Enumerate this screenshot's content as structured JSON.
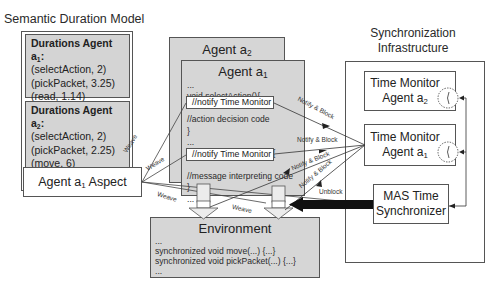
{
  "semantic_model": {
    "title": "Semantic Duration Model",
    "agent1": {
      "heading": "Durations Agent a",
      "heading_sub": "1",
      "heading_suffix": ":",
      "entries": [
        "(selectAction, 2)",
        "(pickPacket, 3.25)",
        "(read, 1.14)",
        "(move, 5)"
      ]
    },
    "agent2": {
      "heading": "Durations Agent a",
      "heading_sub": "2",
      "heading_suffix": ":",
      "entries": [
        "(selectAction, 2)",
        "(pickPacket, 2.25)",
        "(move, 6)"
      ]
    }
  },
  "aspect": {
    "label": "Agent a",
    "label_sub": "1",
    "label_suffix": " Aspect"
  },
  "agent2_box": {
    "title": "Agent a",
    "title_sub": "2"
  },
  "agent1_box": {
    "title": "Agent a",
    "title_sub": "1",
    "code_lines": [
      "...",
      "void selectAction(){",
      "//notify Time Monitor",
      "//action decision code",
      "}",
      "...",
      "void read(Message m){",
      "//notify Time Monitor",
      "//message interpreting code",
      "}",
      "..."
    ]
  },
  "environment": {
    "title": "Environment",
    "code_lines": [
      "...",
      "synchronized void move(...) {...}",
      "synchronized void pickPacket(...) {...}",
      "..."
    ]
  },
  "sync_infra": {
    "title_line1": "Synchronization",
    "title_line2": "Infrastructure",
    "monitor2": {
      "line1": "Time Monitor",
      "line2": "Agent a",
      "line2_sub": "2",
      "icon": "clock-icon"
    },
    "monitor1": {
      "line1": "Time Monitor",
      "line2": "Agent a",
      "line2_sub": "1",
      "icon": "clock-icon"
    },
    "synchronizer": {
      "line1": "MAS Time",
      "line2": "Synchronizer"
    }
  },
  "edge_labels": {
    "weave": "Weave",
    "notify_block": "Notify & Block",
    "unblock": "Unblock"
  }
}
